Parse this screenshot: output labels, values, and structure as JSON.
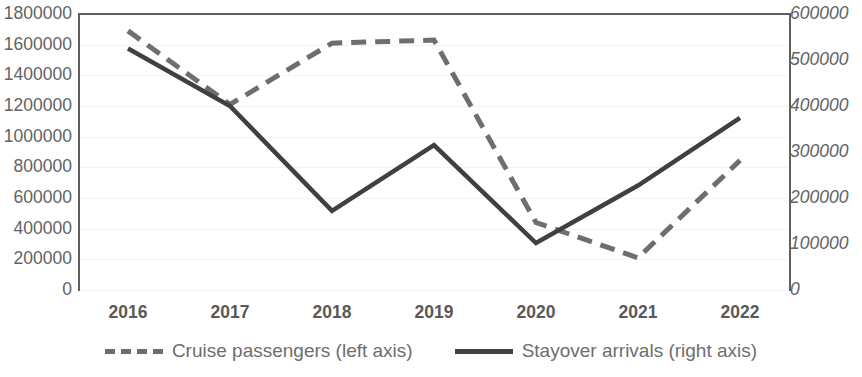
{
  "chart_data": {
    "type": "line",
    "title": "",
    "subtitle": "",
    "xlabel": "",
    "categories": [
      "2016",
      "2017",
      "2018",
      "2019",
      "2020",
      "2021",
      "2022"
    ],
    "grid": true,
    "legend_position": "bottom",
    "axes": {
      "left": {
        "label": "",
        "ylim": [
          0,
          1800000
        ],
        "tick_step": 200000,
        "ticks": [
          "1800000",
          "1600000",
          "1400000",
          "1200000",
          "1000000",
          "800000",
          "600000",
          "400000",
          "200000",
          "0"
        ],
        "italic": false
      },
      "right": {
        "label": "",
        "ylim": [
          0,
          600000
        ],
        "tick_step": 100000,
        "ticks": [
          "600000",
          "500000",
          "400000",
          "300000",
          "200000",
          "100000",
          "0"
        ],
        "italic": true
      }
    },
    "series": [
      {
        "name": "Cruise passengers (left axis)",
        "axis": "left",
        "style": "dashed",
        "color": "#6e6e6e",
        "values": [
          1690000,
          1210000,
          1610000,
          1630000,
          440000,
          210000,
          845000
        ]
      },
      {
        "name": "Stayover arrivals (right axis)",
        "axis": "right",
        "style": "solid",
        "color": "#404040",
        "values": [
          525000,
          400000,
          172000,
          315000,
          102000,
          227000,
          374000
        ]
      }
    ],
    "legend": [
      {
        "label": "Cruise passengers (left axis)",
        "style": "dashed",
        "color": "#6e6e6e"
      },
      {
        "label": "Stayover arrivals (right axis)",
        "style": "solid",
        "color": "#404040"
      }
    ],
    "colors": {
      "axis": "#5f5f5f",
      "gridline": "#f4f2f2",
      "tick_text": "#636363",
      "xtick_text": "#595959",
      "legend_text": "#6e6e6e",
      "background": "#ffffff"
    }
  }
}
